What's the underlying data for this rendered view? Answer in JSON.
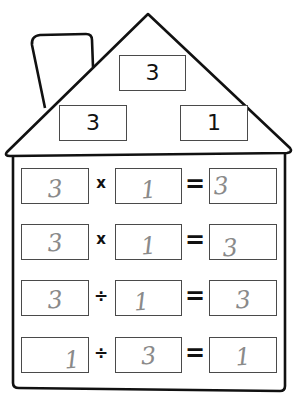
{
  "worksheet": {
    "title": "Fact family house",
    "roof": {
      "top_number": "3",
      "left_number": "3",
      "right_number": "1"
    },
    "equations": [
      {
        "a": "3",
        "op": "x",
        "b": "1",
        "eq": "=",
        "result": "3"
      },
      {
        "a": "3",
        "op": "x",
        "b": "1",
        "eq": "=",
        "result": "3"
      },
      {
        "a": "3",
        "op": "÷",
        "b": "1",
        "eq": "=",
        "result": "3"
      },
      {
        "a": "1",
        "op": "÷",
        "b": "3",
        "eq": "=",
        "result": "1"
      }
    ]
  },
  "colors": {
    "outline": "#111111",
    "box_border": "#4a4a4a",
    "handwriting": "#8a8a8a"
  }
}
